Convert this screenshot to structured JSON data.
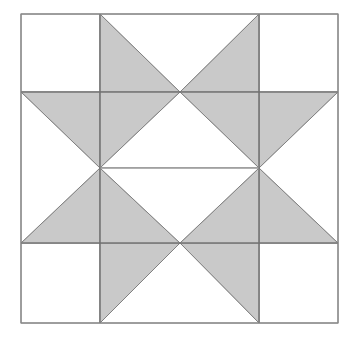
{
  "figure": {
    "type": "geometric-pattern",
    "background_color": "#ffffff",
    "fill_color": "#c9c9c9",
    "empty_color": "#ffffff",
    "line_color": "#6e6e6e",
    "border_color": "#888888",
    "canvas": {
      "width": 355,
      "height": 341
    },
    "block": {
      "left": 21,
      "top": 14,
      "right": 338,
      "bottom": 323,
      "width": 317,
      "height": 309
    },
    "grid": {
      "vertical_lines": [
        100,
        259
      ],
      "horizontal_lines": [
        92,
        243
      ],
      "center_vertical": 180,
      "center_horizontal": 168,
      "columns": 3,
      "rows": 3
    },
    "vertices": {
      "top_left": "21,14",
      "top_mid_left": "100,14",
      "top_mid_right": "259,14",
      "top_right": "338,14",
      "mid_upper_left": "21,92",
      "center_upper": "180,92",
      "mid_upper_right": "338,92",
      "left_point": "100,168",
      "right_point": "259,168",
      "mid_lower_left": "21,243",
      "center_lower": "180,243",
      "mid_lower_right": "338,243",
      "bottom_left": "21,323",
      "bottom_mid_left": "100,323",
      "bottom_mid_right": "259,323",
      "bottom_right": "338,323"
    },
    "shapes": [
      {
        "name": "top-left-corner-square",
        "fill": "white",
        "points": "21,14 100,14 100,92 21,92"
      },
      {
        "name": "top-right-corner-square",
        "fill": "white",
        "points": "259,14 338,14 338,92 259,92"
      },
      {
        "name": "bottom-left-corner-square",
        "fill": "white",
        "points": "21,243 100,243 100,323 21,323"
      },
      {
        "name": "bottom-right-corner-square",
        "fill": "white",
        "points": "259,243 338,243 338,323 259,323"
      },
      {
        "name": "star-point-top-left-half",
        "fill": "gray",
        "points": "100,14 180,92 100,92"
      },
      {
        "name": "star-point-top-right-half",
        "fill": "gray",
        "points": "259,14 259,92 180,92"
      },
      {
        "name": "top-notch-white-triangle",
        "fill": "white",
        "points": "100,14 259,14 180,92"
      },
      {
        "name": "star-point-bottom-left-half",
        "fill": "gray",
        "points": "100,243 180,243 100,323"
      },
      {
        "name": "star-point-bottom-right-half",
        "fill": "gray",
        "points": "180,243 259,243 259,323"
      },
      {
        "name": "bottom-notch-white-triangle",
        "fill": "white",
        "points": "100,323 180,243 259,323"
      },
      {
        "name": "star-point-left-upper-half",
        "fill": "gray",
        "points": "21,92 100,92 100,168"
      },
      {
        "name": "star-point-left-lower-half",
        "fill": "gray",
        "points": "21,243 100,168 100,243"
      },
      {
        "name": "left-notch-white-triangle",
        "fill": "white",
        "points": "21,92 100,168 21,243"
      },
      {
        "name": "star-point-right-upper-half",
        "fill": "gray",
        "points": "259,92 338,92 259,168"
      },
      {
        "name": "star-point-right-lower-half",
        "fill": "gray",
        "points": "259,168 338,243 259,243"
      },
      {
        "name": "right-notch-white-triangle",
        "fill": "white",
        "points": "338,92 338,243 259,168"
      },
      {
        "name": "diagonal-star-arm-upper-left",
        "fill": "gray",
        "points": "100,92 180,92 100,168"
      },
      {
        "name": "diagonal-star-arm-upper-right",
        "fill": "gray",
        "points": "180,92 259,92 259,168"
      },
      {
        "name": "diagonal-star-arm-lower-left",
        "fill": "gray",
        "points": "100,168 100,243 180,243"
      },
      {
        "name": "diagonal-star-arm-lower-right",
        "fill": "gray",
        "points": "259,168 259,243 180,243"
      },
      {
        "name": "center-white-upper-triangle",
        "fill": "white",
        "points": "100,168 180,92 259,168"
      },
      {
        "name": "center-white-lower-triangle",
        "fill": "white",
        "points": "100,168 259,168 180,243"
      }
    ],
    "lines": [
      {
        "name": "grid-vertical-left",
        "x1": 100,
        "y1": 14,
        "x2": 100,
        "y2": 323,
        "weight": "normal"
      },
      {
        "name": "grid-vertical-right",
        "x1": 259,
        "y1": 14,
        "x2": 259,
        "y2": 323,
        "weight": "normal"
      },
      {
        "name": "grid-horizontal-upper",
        "x1": 21,
        "y1": 92,
        "x2": 338,
        "y2": 92,
        "weight": "normal"
      },
      {
        "name": "grid-horizontal-lower",
        "x1": 21,
        "y1": 243,
        "x2": 338,
        "y2": 243,
        "weight": "normal"
      },
      {
        "name": "center-waist-line",
        "x1": 100,
        "y1": 168,
        "x2": 259,
        "y2": 168,
        "weight": "thin"
      }
    ]
  }
}
